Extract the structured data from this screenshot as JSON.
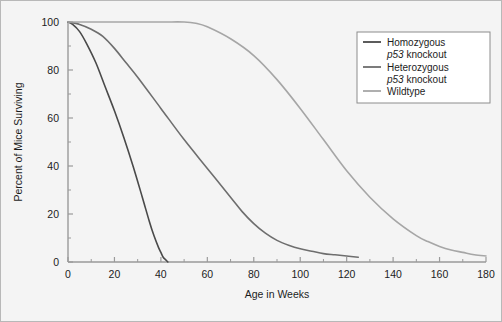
{
  "chart_data": {
    "type": "line",
    "title": "",
    "xlabel": "Age in Weeks",
    "ylabel": "Percent of Mice Surviving",
    "xlim": [
      0,
      180
    ],
    "ylim": [
      0,
      100
    ],
    "xticks": [
      0,
      20,
      40,
      60,
      80,
      100,
      120,
      140,
      160,
      180
    ],
    "yticks": [
      0,
      20,
      40,
      60,
      80,
      100
    ],
    "xtick_labels": [
      "0",
      "20",
      "40",
      "60",
      "80",
      "100",
      "120",
      "140",
      "160",
      "180"
    ],
    "ytick_labels": [
      "0",
      "20",
      "40",
      "60",
      "80",
      "100"
    ],
    "minor_tick_interval_x": 10,
    "minor_tick_interval_y": 10,
    "grid": false,
    "legend_position": "upper right",
    "series": [
      {
        "name": "Homozygous p53 knockout",
        "label_line1": "Homozygous",
        "label_line2": "p53 knockout",
        "label_line2_italic_prefix": "p53",
        "color": "#4a4a4a",
        "x": [
          0,
          2,
          5,
          8,
          12,
          16,
          20,
          24,
          28,
          32,
          35,
          37,
          39,
          40,
          41,
          42,
          43
        ],
        "y": [
          100,
          99,
          96,
          91,
          83,
          73,
          63,
          52,
          40,
          27,
          17,
          11,
          6,
          4,
          2,
          1,
          0
        ]
      },
      {
        "name": "Heterozygous p53 knockout",
        "label_line1": "Heterozygous",
        "label_line2": "p53 knockout",
        "label_line2_italic_prefix": "p53",
        "color": "#6e6e6e",
        "x": [
          0,
          5,
          10,
          15,
          20,
          25,
          30,
          40,
          50,
          60,
          70,
          75,
          80,
          85,
          90,
          95,
          100,
          105,
          110,
          115,
          120,
          125
        ],
        "y": [
          100,
          99,
          97,
          94,
          89,
          83,
          77,
          64,
          51,
          39,
          27,
          21,
          16,
          12,
          9,
          7,
          5.5,
          4.5,
          3.5,
          3,
          2.5,
          2
        ]
      },
      {
        "name": "Wildtype",
        "label_line1": "Wildtype",
        "color": "#a6a6a6",
        "x": [
          0,
          20,
          40,
          50,
          55,
          60,
          70,
          80,
          90,
          100,
          110,
          120,
          130,
          140,
          150,
          155,
          160,
          165,
          170,
          175,
          180
        ],
        "y": [
          100,
          100,
          100,
          100,
          99.5,
          98,
          93,
          86,
          76,
          64,
          51,
          38,
          27,
          18,
          11,
          8.5,
          6.5,
          5,
          4,
          3,
          2.5
        ]
      }
    ]
  },
  "legend": {
    "items": [
      {
        "line1": "Homozygous",
        "line2_italic": "p53",
        "line2_rest": " knockout"
      },
      {
        "line1": "Heterozygous",
        "line2_italic": "p53",
        "line2_rest": " knockout"
      },
      {
        "line1": "Wildtype",
        "line2_italic": "",
        "line2_rest": ""
      }
    ]
  }
}
